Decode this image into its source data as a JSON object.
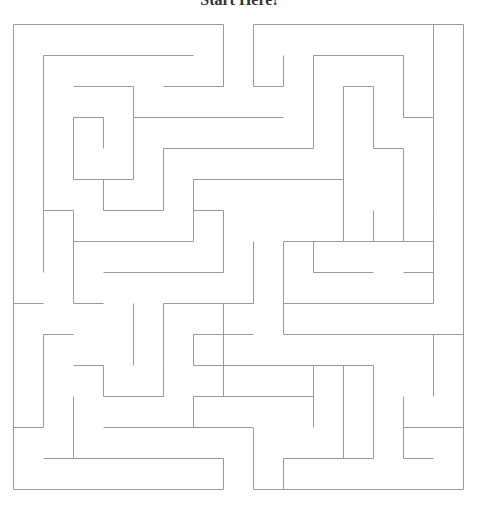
{
  "title": "Start Here!",
  "maze": {
    "stroke": "#9a9a9a",
    "walls": [
      [
        13,
        24,
        223,
        24
      ],
      [
        253,
        24,
        463,
        24
      ],
      [
        433,
        24,
        433,
        117
      ],
      [
        463,
        24,
        463,
        489
      ],
      [
        223,
        24,
        223,
        86
      ],
      [
        163,
        86,
        223,
        86
      ],
      [
        43,
        55,
        193,
        55
      ],
      [
        43,
        55,
        43,
        272
      ],
      [
        253,
        24,
        253,
        86
      ],
      [
        253,
        86,
        283,
        86
      ],
      [
        283,
        55,
        283,
        86
      ],
      [
        313,
        55,
        403,
        55
      ],
      [
        313,
        55,
        313,
        148
      ],
      [
        403,
        55,
        403,
        117
      ],
      [
        403,
        117,
        433,
        117
      ],
      [
        433,
        117,
        433,
        210
      ],
      [
        343,
        86,
        373,
        86
      ],
      [
        343,
        86,
        343,
        179
      ],
      [
        373,
        86,
        373,
        148
      ],
      [
        73,
        86,
        133,
        86
      ],
      [
        133,
        86,
        133,
        117
      ],
      [
        133,
        117,
        283,
        117
      ],
      [
        73,
        117,
        103,
        117
      ],
      [
        73,
        117,
        73,
        179
      ],
      [
        103,
        117,
        103,
        148
      ],
      [
        73,
        179,
        133,
        179
      ],
      [
        133,
        117,
        133,
        179
      ],
      [
        373,
        148,
        403,
        148
      ],
      [
        403,
        148,
        403,
        241
      ],
      [
        403,
        241,
        433,
        241
      ],
      [
        163,
        148,
        313,
        148
      ],
      [
        163,
        148,
        163,
        210
      ],
      [
        103,
        179,
        103,
        210
      ],
      [
        103,
        210,
        163,
        210
      ],
      [
        193,
        179,
        343,
        179
      ],
      [
        193,
        179,
        193,
        241
      ],
      [
        343,
        179,
        343,
        241
      ],
      [
        343,
        241,
        403,
        241
      ],
      [
        373,
        210,
        373,
        241
      ],
      [
        433,
        210,
        433,
        303
      ],
      [
        13,
        24,
        13,
        489
      ],
      [
        43,
        210,
        73,
        210
      ],
      [
        73,
        210,
        73,
        303
      ],
      [
        73,
        241,
        193,
        241
      ],
      [
        193,
        210,
        223,
        210
      ],
      [
        223,
        210,
        223,
        272
      ],
      [
        283,
        241,
        343,
        241
      ],
      [
        283,
        241,
        283,
        334
      ],
      [
        313,
        241,
        313,
        272
      ],
      [
        313,
        272,
        373,
        272
      ],
      [
        403,
        272,
        433,
        272
      ],
      [
        103,
        272,
        223,
        272
      ],
      [
        223,
        303,
        253,
        303
      ],
      [
        253,
        241,
        253,
        303
      ],
      [
        283,
        303,
        433,
        303
      ],
      [
        13,
        303,
        43,
        303
      ],
      [
        73,
        303,
        103,
        303
      ],
      [
        133,
        303,
        133,
        365
      ],
      [
        163,
        303,
        163,
        365
      ],
      [
        163,
        303,
        223,
        303
      ],
      [
        283,
        334,
        463,
        334
      ],
      [
        193,
        334,
        253,
        334
      ],
      [
        193,
        334,
        193,
        365
      ],
      [
        193,
        365,
        373,
        365
      ],
      [
        433,
        334,
        433,
        396
      ],
      [
        43,
        334,
        43,
        427
      ],
      [
        43,
        334,
        73,
        334
      ],
      [
        73,
        365,
        103,
        365
      ],
      [
        103,
        365,
        103,
        396
      ],
      [
        103,
        396,
        163,
        396
      ],
      [
        163,
        365,
        163,
        396
      ],
      [
        223,
        303,
        223,
        396
      ],
      [
        193,
        396,
        313,
        396
      ],
      [
        193,
        396,
        193,
        427
      ],
      [
        313,
        365,
        313,
        427
      ],
      [
        343,
        365,
        343,
        458
      ],
      [
        373,
        365,
        373,
        427
      ],
      [
        13,
        427,
        43,
        427
      ],
      [
        73,
        396,
        73,
        458
      ],
      [
        103,
        427,
        253,
        427
      ],
      [
        253,
        427,
        253,
        489
      ],
      [
        283,
        458,
        373,
        458
      ],
      [
        283,
        458,
        283,
        489
      ],
      [
        373,
        427,
        373,
        458
      ],
      [
        403,
        396,
        403,
        458
      ],
      [
        403,
        427,
        463,
        427
      ],
      [
        403,
        458,
        433,
        458
      ],
      [
        43,
        458,
        223,
        458
      ],
      [
        223,
        458,
        223,
        489
      ],
      [
        13,
        489,
        223,
        489
      ],
      [
        253,
        489,
        463,
        489
      ]
    ]
  }
}
